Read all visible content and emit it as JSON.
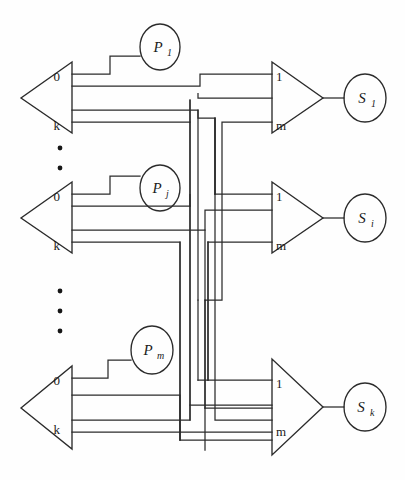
{
  "figure": {
    "background_color": "#fefefe",
    "line_color": "#2b2b2b",
    "width": 405,
    "height": 480
  },
  "blocks": [
    {
      "id": "block-1",
      "source_ports": {
        "top": "0",
        "bottom": "k"
      },
      "process_label": {
        "base": "P",
        "sub": "1"
      },
      "dest_ports": {
        "top": "1",
        "bottom": "m"
      },
      "sink_label": {
        "base": "S",
        "sub": "1"
      }
    },
    {
      "id": "block-2",
      "source_ports": {
        "top": "0",
        "bottom": "k"
      },
      "process_label": {
        "base": "P",
        "sub": "j"
      },
      "dest_ports": {
        "top": "1",
        "bottom": "m"
      },
      "sink_label": {
        "base": "S",
        "sub": "i"
      }
    },
    {
      "id": "block-3",
      "source_ports": {
        "top": "0",
        "bottom": "k"
      },
      "process_label": {
        "base": "P",
        "sub": "m"
      },
      "dest_ports": {
        "top": "1",
        "bottom": "m"
      },
      "sink_label": {
        "base": "S",
        "sub": "k"
      }
    }
  ],
  "ellipses_markers": [
    {
      "id": "vertical-dots-upper",
      "count": 2
    },
    {
      "id": "vertical-dots-lower",
      "count": 3
    }
  ]
}
